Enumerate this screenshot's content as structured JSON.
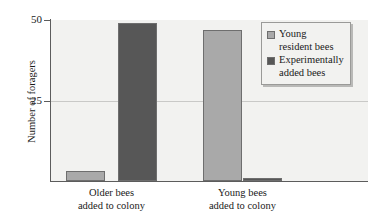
{
  "chart_data": {
    "type": "bar",
    "title": "",
    "subtitle": "",
    "xlabel": "",
    "ylabel": "Number of foragers",
    "ylim": [
      0,
      50
    ],
    "yticks": [
      0,
      25,
      50
    ],
    "ytick_labels": [
      "",
      "25",
      "50"
    ],
    "grid": "horizontal gridline at y = 25 only",
    "legend_position": "upper right, inside plot area",
    "categories": [
      "Older bees\nadded to colony",
      "Young bees\nadded to colony"
    ],
    "category_lines": [
      [
        "Older bees",
        "added to colony"
      ],
      [
        "Young bees",
        "added to colony"
      ]
    ],
    "series": [
      {
        "name": "Young resident bees",
        "name_lines": [
          "Young",
          "resident bees"
        ],
        "color": "#a9a9a9",
        "values": [
          3,
          47
        ]
      },
      {
        "name": "Experimentally added bees",
        "name_lines": [
          "Experimentally",
          "added bees"
        ],
        "color": "#575757",
        "values": [
          49,
          1
        ]
      }
    ],
    "annotations": []
  },
  "style": {
    "plot_background": "#f2f2f0",
    "axis_color": "#5c5c5c",
    "gridline_color": "#c9c9c7",
    "bar_border_color": "#6e6e6e",
    "legend_border_color": "#9a9a98",
    "legend_shadow_color": "#b9b9b7",
    "page_background": "#ffffff"
  }
}
